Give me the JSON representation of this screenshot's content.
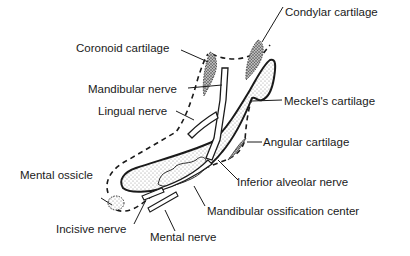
{
  "diagram": {
    "type": "anatomical-illustration",
    "colors": {
      "ink": "#1a1a1a",
      "stipple_light": "#d8d8d8",
      "stipple_dark": "#777777",
      "background": "#ffffff"
    },
    "labels": {
      "condylar_cartilage": "Condylar cartilage",
      "coronoid_cartilage": "Coronoid cartilage",
      "mandibular_nerve": "Mandibular nerve",
      "lingual_nerve": "Lingual nerve",
      "meckels_cartilage": "Meckel's cartilage",
      "angular_cartilage": "Angular cartilage",
      "mental_ossicle": "Mental ossicle",
      "inferior_alveolar_nerve": "Inferior alveolar nerve",
      "mandibular_ossification_center": "Mandibular ossification center",
      "incisive_nerve": "Incisive nerve",
      "mental_nerve": "Mental nerve"
    }
  }
}
